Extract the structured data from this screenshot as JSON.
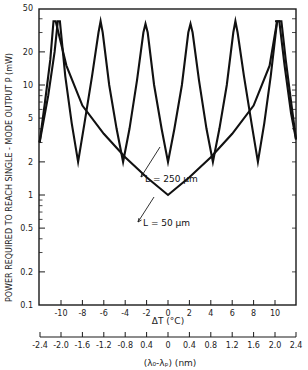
{
  "chart_data": {
    "type": "line",
    "title": "",
    "ylabel": "POWER REQUIRED TO REACH SINGLE - MODE OUTPUT P (mW)",
    "xlabel": "ΔT (°C)",
    "x2label": "(λ₀-λₚ) (nm)",
    "yscale": "log",
    "ylim": [
      0.1,
      50
    ],
    "xlim": [
      -12,
      12
    ],
    "yticks": [
      0.1,
      0.2,
      0.5,
      1,
      2,
      5,
      10,
      20,
      50
    ],
    "ytick_labels": [
      "0.1",
      "0.2",
      "0.5",
      "1",
      "2",
      "5",
      "10",
      "20",
      "50"
    ],
    "xticks": [
      -10,
      -8,
      -6,
      -4,
      -2,
      0,
      2,
      4,
      6,
      8,
      10
    ],
    "xtick_labels": [
      "-10",
      "-8",
      "-6",
      "-4",
      "-2",
      "0",
      "2",
      "4",
      "6",
      "8",
      "10"
    ],
    "x2ticks": [
      -12,
      -10,
      -8,
      -6,
      -4,
      -2,
      0,
      2,
      4,
      6,
      8,
      10,
      12
    ],
    "x2tick_labels": [
      "-2.4",
      "-2.0",
      "-1.6",
      "-1.2",
      "-0.8",
      "0.4",
      "0",
      "0.4",
      "0.8",
      "1.2",
      "1.6",
      "2.0",
      "2.4"
    ],
    "grid": false,
    "series": [
      {
        "name": "L = 250 μm",
        "points": [
          [
            -12.0,
            3.0
          ],
          [
            -11.2,
            8
          ],
          [
            -10.6,
            20
          ],
          [
            -10.3,
            38
          ],
          [
            -10.1,
            38
          ],
          [
            -9.6,
            12
          ],
          [
            -9.0,
            4.5
          ],
          [
            -8.4,
            2.0
          ],
          [
            -7.8,
            4.5
          ],
          [
            -7.1,
            12
          ],
          [
            -6.5,
            30
          ],
          [
            -6.3,
            38
          ],
          [
            -6.1,
            30
          ],
          [
            -5.5,
            10
          ],
          [
            -4.8,
            4.0
          ],
          [
            -4.2,
            2.0
          ],
          [
            -3.6,
            4.0
          ],
          [
            -2.9,
            11
          ],
          [
            -2.3,
            30
          ],
          [
            -2.1,
            36
          ],
          [
            -1.9,
            30
          ],
          [
            -1.3,
            10
          ],
          [
            -0.6,
            4.0
          ],
          [
            0.0,
            2.0
          ],
          [
            0.6,
            4.0
          ],
          [
            1.3,
            10
          ],
          [
            1.9,
            30
          ],
          [
            2.1,
            36
          ],
          [
            2.3,
            30
          ],
          [
            2.9,
            11
          ],
          [
            3.6,
            4.0
          ],
          [
            4.2,
            2.0
          ],
          [
            4.8,
            4.0
          ],
          [
            5.5,
            10
          ],
          [
            6.1,
            30
          ],
          [
            6.3,
            38
          ],
          [
            6.5,
            30
          ],
          [
            7.1,
            12
          ],
          [
            7.8,
            4.5
          ],
          [
            8.4,
            2.0
          ],
          [
            9.0,
            4.5
          ],
          [
            9.6,
            12
          ],
          [
            10.2,
            38
          ],
          [
            10.4,
            38
          ],
          [
            10.9,
            15
          ],
          [
            11.5,
            5.5
          ],
          [
            12.0,
            3.2
          ]
        ]
      },
      {
        "name": "L = 50 μm",
        "points": [
          [
            -12.0,
            3.0
          ],
          [
            -11.5,
            7
          ],
          [
            -11.0,
            17
          ],
          [
            -10.7,
            38
          ],
          [
            -10.5,
            38
          ],
          [
            -9.5,
            15
          ],
          [
            -8.0,
            6.5
          ],
          [
            -6.0,
            3.6
          ],
          [
            -4.0,
            2.2
          ],
          [
            -2.0,
            1.45
          ],
          [
            0.0,
            1.0
          ],
          [
            2.0,
            1.45
          ],
          [
            4.0,
            2.2
          ],
          [
            6.0,
            3.6
          ],
          [
            8.0,
            6.5
          ],
          [
            9.5,
            15
          ],
          [
            10.2,
            38
          ],
          [
            10.0,
            38
          ],
          [
            10.6,
            38
          ],
          [
            11.0,
            17
          ],
          [
            11.5,
            7
          ],
          [
            12.0,
            3.2
          ]
        ]
      }
    ],
    "annotations": [
      {
        "text": "L = 250 μm",
        "arrow_to": [
          -0.8,
          2.6
        ]
      },
      {
        "text": "L = 50 μm",
        "arrow_to": [
          -1.3,
          1.0
        ]
      }
    ],
    "legend": "none"
  },
  "labels": {
    "ylabel": "POWER REQUIRED TO REACH SINGLE - MODE OUTPUT P (mW)",
    "xlabel": "ΔT (°C)",
    "x2label": "(λ₀-λₚ) (nm)",
    "annot_250": "L = 250 μm",
    "annot_50": "L = 50 μm"
  }
}
